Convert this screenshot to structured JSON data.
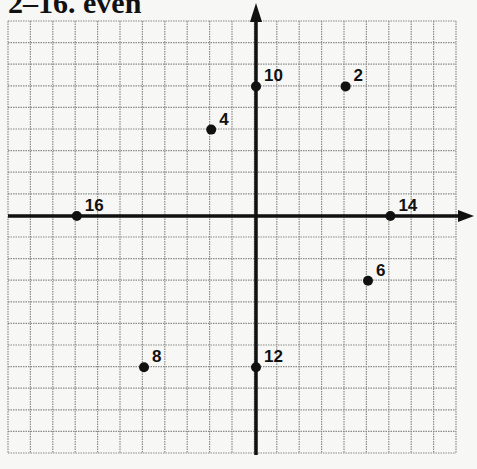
{
  "title": "2–16. even",
  "chart_data": {
    "type": "scatter",
    "title": "2–16. even",
    "xlabel": "",
    "ylabel": "",
    "grid": true,
    "xlim": [
      -11,
      9
    ],
    "ylim": [
      -11,
      9
    ],
    "points": [
      {
        "label": "2",
        "x": 4,
        "y": 6
      },
      {
        "label": "4",
        "x": -2,
        "y": 4
      },
      {
        "label": "6",
        "x": 5,
        "y": -3
      },
      {
        "label": "8",
        "x": -5,
        "y": -7
      },
      {
        "label": "10",
        "x": 0,
        "y": 6
      },
      {
        "label": "12",
        "x": 0,
        "y": -7
      },
      {
        "label": "14",
        "x": 6,
        "y": 0
      },
      {
        "label": "16",
        "x": -8,
        "y": 0
      }
    ]
  },
  "layout": {
    "grid_left": 8,
    "grid_top": 21,
    "cell_w": 22.4,
    "cell_h": 21.6,
    "cols": 20,
    "rows": 20,
    "origin_x": 256,
    "origin_y": 216,
    "colors": {
      "grid": "#8a8a8a",
      "axis": "#111111",
      "point": "#111111",
      "background": "#f7f7f5"
    }
  }
}
